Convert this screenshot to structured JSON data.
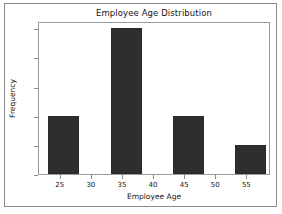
{
  "figure": {
    "background_color": "#ffffff",
    "border_color": "#8a8a8a",
    "axes_color": "#9a9a9a"
  },
  "chart_data": {
    "type": "bar",
    "title": "Employee Age Distribution",
    "xlabel": "Employee Age",
    "ylabel": "Frequency",
    "categories": [
      "25",
      "35",
      "45",
      "55"
    ],
    "bin_centers": [
      25.5,
      35.5,
      45.5,
      55.5
    ],
    "bin_edges": [
      23,
      28,
      33,
      38,
      43,
      48,
      53,
      58
    ],
    "values": [
      2,
      5,
      2,
      1
    ],
    "bars": [
      {
        "label": "25",
        "left": 23,
        "right": 28,
        "value": 2
      },
      {
        "label": "35",
        "left": 33,
        "right": 38,
        "value": 5
      },
      {
        "label": "45",
        "left": 43,
        "right": 48,
        "value": 2
      },
      {
        "label": "55",
        "left": 53,
        "right": 58,
        "value": 1
      }
    ],
    "bar_color": "#2e2e2e",
    "xlim": [
      21.5,
      58.8
    ],
    "ylim": [
      0,
      5.25
    ],
    "xticks": [
      25,
      30,
      35,
      40,
      45,
      50,
      55
    ],
    "xtick_labels": [
      "25",
      "30",
      "35",
      "40",
      "45",
      "50",
      "55"
    ],
    "yticks": [
      0,
      1,
      2,
      3,
      4,
      5
    ],
    "ytick_labels": [
      "0",
      "1",
      "2",
      "3",
      "4",
      "5"
    ],
    "grid": false,
    "legend": null
  }
}
